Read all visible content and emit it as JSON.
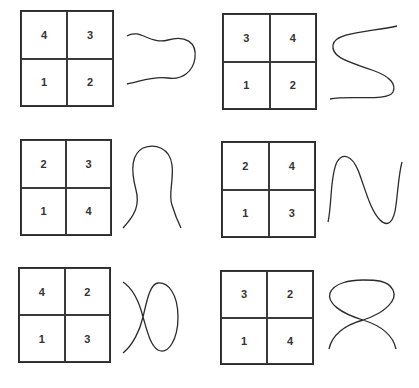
{
  "panels": [
    {
      "id": 1,
      "cells": {
        "tl": "4",
        "tr": "3",
        "bl": "1",
        "br": "2"
      },
      "curve": "c-shape-right"
    },
    {
      "id": 2,
      "cells": {
        "tl": "3",
        "tr": "4",
        "bl": "1",
        "br": "2"
      },
      "curve": "s-shape"
    },
    {
      "id": 3,
      "cells": {
        "tl": "2",
        "tr": "3",
        "bl": "1",
        "br": "4"
      },
      "curve": "inverted-u-bell"
    },
    {
      "id": 4,
      "cells": {
        "tl": "2",
        "tr": "4",
        "bl": "1",
        "br": "3"
      },
      "curve": "n-wave"
    },
    {
      "id": 5,
      "cells": {
        "tl": "4",
        "tr": "2",
        "bl": "1",
        "br": "3"
      },
      "curve": "loop-horizontal-crossing"
    },
    {
      "id": 6,
      "cells": {
        "tl": "3",
        "tr": "2",
        "bl": "1",
        "br": "4"
      },
      "curve": "loop-vertical-crossing"
    }
  ]
}
